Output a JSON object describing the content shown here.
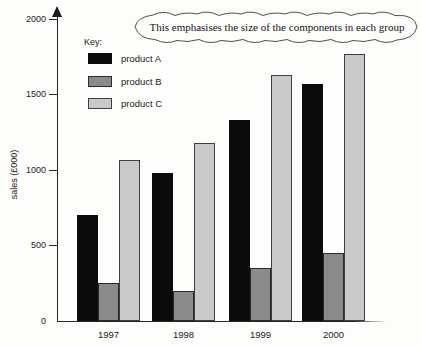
{
  "figure": {
    "annotation": "This emphasises the size of the components in each group",
    "y_axis_label": "sales (£000)",
    "legend": {
      "title": "Key:",
      "items": [
        {
          "label": "product A",
          "color": "#0b0b0b",
          "border": "#0b0b0b"
        },
        {
          "label": "product B",
          "color": "#8a8a8a",
          "border": "#2a2a2a"
        },
        {
          "label": "product C",
          "color": "#c9c9c9",
          "border": "#3f3f3f"
        }
      ]
    }
  },
  "chart_data": {
    "type": "bar",
    "title": "",
    "categories": [
      "1997",
      "1998",
      "1999",
      "2000"
    ],
    "series": [
      {
        "name": "product A",
        "color": "#0b0b0b",
        "values": [
          700,
          980,
          1330,
          1570
        ]
      },
      {
        "name": "product B",
        "color": "#8a8a8a",
        "values": [
          250,
          200,
          350,
          450
        ]
      },
      {
        "name": "product C",
        "color": "#c9c9c9",
        "values": [
          1070,
          1180,
          1630,
          1770
        ]
      }
    ],
    "xlabel": "",
    "ylabel": "sales (£000)",
    "ylim": [
      0,
      2000
    ],
    "y_ticks": [
      0,
      500,
      1000,
      1500,
      2000
    ],
    "grid": false,
    "legend_position": "upper-left",
    "annotation": "This emphasises the size of the components in each group"
  }
}
